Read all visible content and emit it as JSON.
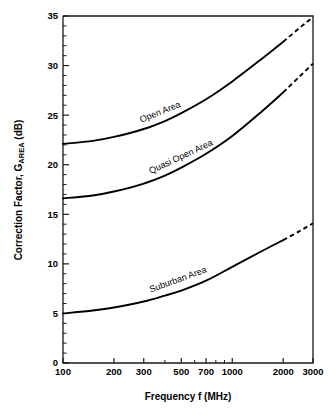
{
  "chart_data": {
    "type": "line",
    "title": "",
    "xlabel": "Frequency f (MHz)",
    "ylabel": "Correction Factor, G",
    "ylabel_sub": "AREA",
    "ylabel_unit": " (dB)",
    "xscale": "log",
    "xlim": [
      100,
      3000
    ],
    "ylim": [
      0,
      35
    ],
    "xticks": [
      100,
      200,
      300,
      500,
      700,
      1000,
      2000,
      3000
    ],
    "xticklabels": [
      "100",
      "200",
      "300",
      "500",
      "700",
      "1000",
      "2000",
      "3000"
    ],
    "yticks": [
      0,
      5,
      10,
      15,
      20,
      25,
      30,
      35
    ],
    "yticklabels": [
      "0",
      "5",
      "10",
      "15",
      "20",
      "25",
      "30",
      "35"
    ],
    "y_minor_step": 1,
    "grid": false,
    "legend": "inline-curve-labels",
    "line_color": "#000000",
    "series": [
      {
        "name": "Open Area",
        "label": "Open Area",
        "solid_range": [
          100,
          2000
        ],
        "dashed_range": [
          2000,
          3000
        ],
        "x": [
          100,
          150,
          200,
          300,
          400,
          500,
          700,
          1000,
          1500,
          2000,
          2500,
          3000
        ],
        "values": [
          22.1,
          22.4,
          22.8,
          23.6,
          24.4,
          25.2,
          26.6,
          28.4,
          30.7,
          32.4,
          33.8,
          34.9
        ]
      },
      {
        "name": "Quasi Open Area",
        "label": "Quasi Open Area",
        "solid_range": [
          100,
          2000
        ],
        "dashed_range": [
          2000,
          3000
        ],
        "x": [
          100,
          150,
          200,
          300,
          400,
          500,
          700,
          1000,
          1500,
          2000,
          2500,
          3000
        ],
        "values": [
          16.6,
          16.9,
          17.3,
          18.1,
          18.9,
          19.7,
          21.1,
          22.9,
          25.4,
          27.3,
          28.9,
          30.2
        ]
      },
      {
        "name": "Suburban Area",
        "label": "Suburban Area",
        "solid_range": [
          100,
          2000
        ],
        "dashed_range": [
          2000,
          3000
        ],
        "x": [
          100,
          150,
          200,
          300,
          400,
          500,
          700,
          1000,
          1500,
          2000,
          2500,
          3000
        ],
        "values": [
          5.0,
          5.3,
          5.6,
          6.2,
          6.8,
          7.3,
          8.3,
          9.7,
          11.3,
          12.4,
          13.3,
          14.1
        ]
      }
    ]
  }
}
